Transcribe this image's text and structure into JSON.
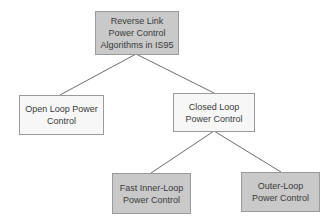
{
  "diagram": {
    "type": "tree",
    "colors": {
      "gray_fill": "#c9c9c9",
      "white_fill": "#f7f7f7",
      "border": "#9a9a9a",
      "connector": "#6e6e6e",
      "text": "#3a3a3a"
    },
    "nodes": {
      "root": {
        "label": "Reverse Link Power Control Algorithms in IS95",
        "style": "gray"
      },
      "open_loop": {
        "label": "Open Loop Power Control",
        "style": "white"
      },
      "closed_loop": {
        "label": "Closed Loop Power Control",
        "style": "white"
      },
      "fast_inner_loop": {
        "label": "Fast Inner-Loop Power Control",
        "style": "gray"
      },
      "outer_loop": {
        "label": "Outer-Loop Power Control",
        "style": "gray"
      }
    },
    "edges": [
      {
        "from": "root",
        "to": "open_loop"
      },
      {
        "from": "root",
        "to": "closed_loop"
      },
      {
        "from": "closed_loop",
        "to": "fast_inner_loop"
      },
      {
        "from": "closed_loop",
        "to": "outer_loop"
      }
    ]
  }
}
